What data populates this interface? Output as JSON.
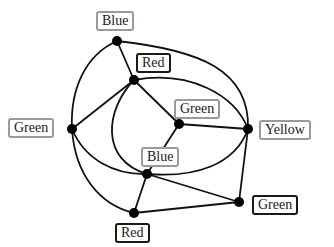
{
  "diagram": {
    "type": "graph-coloring",
    "nodes": [
      {
        "id": "n1",
        "label": "Blue",
        "x": 117,
        "y": 41,
        "lx": 96,
        "ly": 11,
        "style": "light"
      },
      {
        "id": "n2",
        "label": "Red",
        "x": 134,
        "y": 80,
        "lx": 136,
        "ly": 53,
        "style": "dark"
      },
      {
        "id": "n3",
        "label": "Green",
        "x": 72,
        "y": 129,
        "lx": 8,
        "ly": 118,
        "style": "light"
      },
      {
        "id": "n4",
        "label": "Green",
        "x": 179,
        "y": 124,
        "lx": 174,
        "ly": 99,
        "style": "light"
      },
      {
        "id": "n5",
        "label": "Yellow",
        "x": 248,
        "y": 129,
        "lx": 259,
        "ly": 120,
        "style": "light"
      },
      {
        "id": "n6",
        "label": "Blue",
        "x": 147,
        "y": 174,
        "lx": 141,
        "ly": 147,
        "style": "light"
      },
      {
        "id": "n7",
        "label": "Red",
        "x": 134,
        "y": 213,
        "lx": 115,
        "ly": 223,
        "style": "dark"
      },
      {
        "id": "n8",
        "label": "Green",
        "x": 239,
        "y": 202,
        "lx": 252,
        "ly": 195,
        "style": "dark"
      }
    ],
    "edges": [
      {
        "from": "n1",
        "to": "n2",
        "path": "M117,41 L134,80"
      },
      {
        "from": "n1",
        "to": "n3",
        "path": "M117,41 C85,55 70,90 72,129"
      },
      {
        "from": "n1",
        "to": "n5",
        "path": "M117,41 C200,50 250,70 248,129"
      },
      {
        "from": "n2",
        "to": "n3",
        "path": "M134,80 L72,129"
      },
      {
        "from": "n2",
        "to": "n4",
        "path": "M134,80 L179,124"
      },
      {
        "from": "n2",
        "to": "n5",
        "path": "M134,80 C190,70 235,95 248,129"
      },
      {
        "from": "n2",
        "to": "n6",
        "path": "M134,80 C105,110 100,160 147,174"
      },
      {
        "from": "n3",
        "to": "n6",
        "path": "M72,129 C85,160 115,175 147,174"
      },
      {
        "from": "n3",
        "to": "n7",
        "path": "M72,129 C75,175 100,205 134,213"
      },
      {
        "from": "n4",
        "to": "n5",
        "path": "M179,124 L248,129"
      },
      {
        "from": "n4",
        "to": "n6",
        "path": "M179,124 L147,174"
      },
      {
        "from": "n5",
        "to": "n6",
        "path": "M248,129 C235,165 195,178 147,174"
      },
      {
        "from": "n5",
        "to": "n8",
        "path": "M248,129 L239,202"
      },
      {
        "from": "n6",
        "to": "n7",
        "path": "M147,174 L134,213"
      },
      {
        "from": "n6",
        "to": "n8",
        "path": "M147,174 L239,202"
      },
      {
        "from": "n7",
        "to": "n8",
        "path": "M134,213 L239,202"
      }
    ],
    "colors": {
      "edge": "#111111",
      "node": "#000000",
      "light_border": "#9a9a9a",
      "dark_border": "#1a1a1a"
    }
  }
}
